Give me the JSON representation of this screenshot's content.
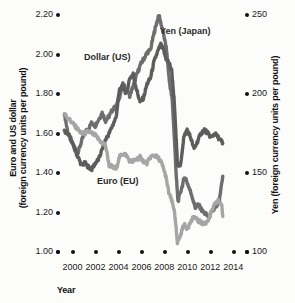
{
  "chart_data": {
    "type": "line",
    "title": "",
    "xlabel": "Year",
    "ylabel": "Euro and US dollar (foreign currency units per pound)",
    "y2label": "Yen (foreign currency units per pound)",
    "xlim": [
      1999,
      2014.5
    ],
    "ylim": [
      1.0,
      2.2
    ],
    "y2lim": [
      100,
      250
    ],
    "grid": false,
    "legend_position": "inline-annotations",
    "x_ticks": [
      "2000",
      "2002",
      "2004",
      "2006",
      "2008",
      "2010",
      "2012",
      "2014"
    ],
    "x_tick_values": [
      2000,
      2002,
      2004,
      2006,
      2008,
      2010,
      2012,
      2014
    ],
    "y_ticks": [
      "1.00",
      "1.20",
      "1.40",
      "1.60",
      "1.80",
      "2.00",
      "2.20"
    ],
    "y_tick_values": [
      1.0,
      1.2,
      1.4,
      1.6,
      1.8,
      2.0,
      2.2
    ],
    "y2_ticks": [
      "100",
      "150",
      "200",
      "250"
    ],
    "y2_tick_values": [
      100,
      150,
      200,
      250
    ],
    "series": [
      {
        "name": "Yen (Japan)",
        "axis": "right",
        "color": "#6e6e6e",
        "x": [
          1999.2,
          1999.5,
          1999.8,
          2000.1,
          2000.4,
          2000.7,
          2001.0,
          2001.3,
          2001.6,
          2001.9,
          2002.2,
          2002.5,
          2002.8,
          2003.1,
          2003.4,
          2003.7,
          2004.0,
          2004.3,
          2004.6,
          2004.9,
          2005.2,
          2005.5,
          2005.8,
          2006.1,
          2006.4,
          2006.7,
          2007.0,
          2007.2,
          2007.45,
          2007.7,
          2007.9,
          2008.1,
          2008.35,
          2008.6,
          2008.8,
          2008.95,
          2009.1,
          2009.4,
          2009.7,
          2010.0,
          2010.3,
          2010.6,
          2010.9,
          2011.2,
          2011.5,
          2011.8,
          2012.1,
          2012.4,
          2012.7,
          2013.0
        ],
        "y": [
          188,
          176,
          170,
          166,
          163,
          170,
          176,
          178,
          182,
          180,
          184,
          188,
          183,
          186,
          190,
          192,
          198,
          206,
          203,
          199,
          205,
          212,
          218,
          222,
          226,
          228,
          238,
          244,
          250,
          242,
          236,
          228,
          208,
          196,
          170,
          148,
          132,
          140,
          148,
          142,
          136,
          128,
          130,
          126,
          124,
          122,
          126,
          128,
          132,
          148
        ]
      },
      {
        "name": "Dollar (US)",
        "axis": "left",
        "color": "#5d5d5d",
        "x": [
          1999.2,
          1999.5,
          1999.8,
          2000.1,
          2000.4,
          2000.7,
          2001.0,
          2001.3,
          2001.6,
          2001.9,
          2002.2,
          2002.5,
          2002.8,
          2003.1,
          2003.4,
          2003.7,
          2004.0,
          2004.3,
          2004.6,
          2004.9,
          2005.2,
          2005.5,
          2005.8,
          2006.1,
          2006.4,
          2006.7,
          2007.0,
          2007.3,
          2007.6,
          2007.85,
          2008.05,
          2008.3,
          2008.55,
          2008.75,
          2008.9,
          2009.05,
          2009.3,
          2009.6,
          2009.9,
          2010.2,
          2010.5,
          2010.8,
          2011.1,
          2011.4,
          2011.7,
          2012.0,
          2012.3,
          2012.6,
          2012.9,
          2013.0
        ],
        "y": [
          1.61,
          1.6,
          1.57,
          1.52,
          1.48,
          1.44,
          1.45,
          1.43,
          1.42,
          1.45,
          1.47,
          1.52,
          1.57,
          1.6,
          1.64,
          1.68,
          1.82,
          1.84,
          1.8,
          1.88,
          1.9,
          1.82,
          1.76,
          1.78,
          1.85,
          1.88,
          1.96,
          2.01,
          2.05,
          2.02,
          1.98,
          1.96,
          1.92,
          1.78,
          1.62,
          1.45,
          1.43,
          1.58,
          1.62,
          1.58,
          1.52,
          1.56,
          1.6,
          1.62,
          1.6,
          1.58,
          1.6,
          1.58,
          1.56,
          1.55
        ]
      },
      {
        "name": "Euro (EU)",
        "axis": "left",
        "color": "#a6a6a6",
        "x": [
          1999.2,
          1999.5,
          1999.8,
          2000.1,
          2000.4,
          2000.7,
          2001.0,
          2001.3,
          2001.6,
          2001.9,
          2002.2,
          2002.5,
          2002.8,
          2003.1,
          2003.4,
          2003.7,
          2004.0,
          2004.3,
          2004.6,
          2004.9,
          2005.2,
          2005.5,
          2005.8,
          2006.1,
          2006.4,
          2006.7,
          2007.0,
          2007.3,
          2007.6,
          2007.85,
          2008.05,
          2008.3,
          2008.55,
          2008.75,
          2008.9,
          2009.05,
          2009.3,
          2009.6,
          2009.9,
          2010.2,
          2010.5,
          2010.8,
          2011.1,
          2011.4,
          2011.7,
          2012.0,
          2012.3,
          2012.6,
          2012.9,
          2013.0
        ],
        "y": [
          1.7,
          1.68,
          1.66,
          1.64,
          1.62,
          1.6,
          1.6,
          1.61,
          1.6,
          1.59,
          1.57,
          1.55,
          1.54,
          1.44,
          1.43,
          1.42,
          1.48,
          1.5,
          1.49,
          1.46,
          1.46,
          1.47,
          1.48,
          1.46,
          1.45,
          1.48,
          1.49,
          1.48,
          1.46,
          1.42,
          1.38,
          1.3,
          1.26,
          1.22,
          1.14,
          1.05,
          1.08,
          1.14,
          1.12,
          1.15,
          1.18,
          1.16,
          1.15,
          1.14,
          1.16,
          1.2,
          1.24,
          1.26,
          1.24,
          1.18
        ]
      }
    ],
    "annotations": [
      {
        "text": "Yen (Japan)",
        "x": 2007.0,
        "y": 2.12
      },
      {
        "text": "Dollar (US)",
        "x": 2003.4,
        "y": 1.97
      },
      {
        "text": "Euro (EU)",
        "x": 2004.2,
        "y": 1.38
      }
    ]
  },
  "axes": {
    "left_title": "Euro and US dollar\n(foreign currency units per pound)",
    "left_title_line1": "Euro and US dollar",
    "left_title_line2": "(foreign currency units per pound)",
    "right_title": "Yen (foreign currency units per pound)",
    "x_title": "Year"
  },
  "labels": {
    "yen": "Yen (Japan)",
    "dollar": "Dollar (US)",
    "euro": "Euro (EU)"
  },
  "colors": {
    "yen": "#6e6e6e",
    "dollar": "#5d5d5d",
    "euro": "#a6a6a6",
    "text": "#111111",
    "background": "#fdfdfb"
  }
}
